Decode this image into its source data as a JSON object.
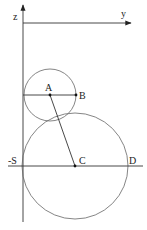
{
  "diagram": {
    "type": "geometry",
    "axes": {
      "vertical_label": "z",
      "horizontal_label": "y"
    },
    "points": {
      "A": "A",
      "B": "B",
      "C": "C",
      "D": "D",
      "S": "-S"
    },
    "colors": {
      "axis": "#333333",
      "circle": "#666666",
      "text": "#222222",
      "background": "#ffffff"
    },
    "elements": [
      "z-axis (vertical, arrow up)",
      "y-axis (horizontal, arrow right)",
      "small circle centered at A with radius AB",
      "large circle centered at C with diameter SD",
      "segment AB",
      "segment AC",
      "horizontal line through S, C, D"
    ]
  }
}
